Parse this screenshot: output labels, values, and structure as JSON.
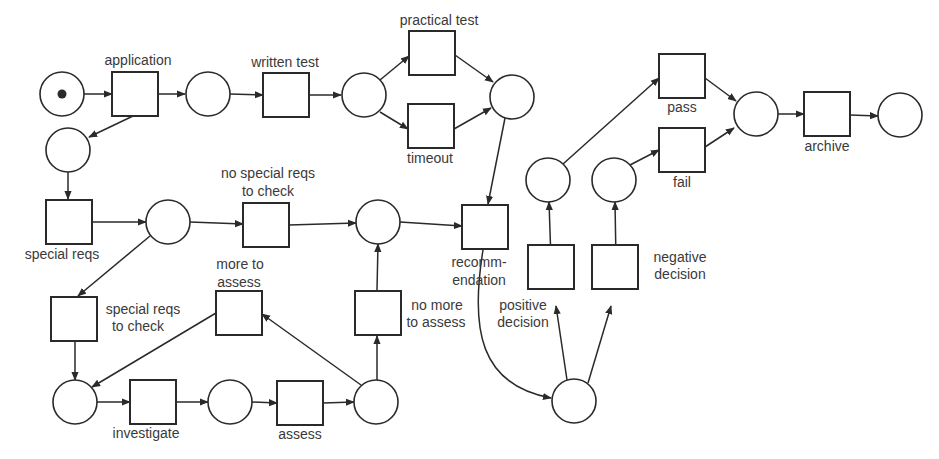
{
  "diagram": {
    "type": "petri-net",
    "colors": {
      "stroke": "#2a2a2a",
      "text": "#3a3a3a",
      "background": "#ffffff",
      "token": "#2a2a2a"
    },
    "transitions": [
      {
        "id": "t_application",
        "label": [
          "application"
        ]
      },
      {
        "id": "t_written_test",
        "label": [
          "written test"
        ]
      },
      {
        "id": "t_practical_test",
        "label": [
          "practical test"
        ]
      },
      {
        "id": "t_timeout",
        "label": [
          "timeout"
        ]
      },
      {
        "id": "t_special_reqs",
        "label": [
          "special reqs"
        ]
      },
      {
        "id": "t_no_special_reqs",
        "label": [
          "no special reqs",
          "to check"
        ]
      },
      {
        "id": "t_recommendation",
        "label": [
          "recomm-",
          "endation"
        ]
      },
      {
        "id": "t_special_reqs_to_check",
        "label": [
          "special reqs",
          "to check"
        ]
      },
      {
        "id": "t_more_to_assess",
        "label": [
          "more to",
          "assess"
        ]
      },
      {
        "id": "t_no_more_to_assess",
        "label": [
          "no more",
          "to assess"
        ]
      },
      {
        "id": "t_investigate",
        "label": [
          "investigate"
        ]
      },
      {
        "id": "t_assess",
        "label": [
          "assess"
        ]
      },
      {
        "id": "t_positive_decision",
        "label": [
          "positive",
          "decision"
        ]
      },
      {
        "id": "t_negative_decision",
        "label": [
          "negative",
          "decision"
        ]
      },
      {
        "id": "t_pass",
        "label": [
          "pass"
        ]
      },
      {
        "id": "t_fail",
        "label": [
          "fail"
        ]
      },
      {
        "id": "t_archive",
        "label": [
          "archive"
        ]
      }
    ],
    "places": [
      {
        "id": "p_start",
        "tokens": 1
      },
      {
        "id": "p_after_application",
        "tokens": 0
      },
      {
        "id": "p_after_written",
        "tokens": 0
      },
      {
        "id": "p_after_practical",
        "tokens": 0
      },
      {
        "id": "p_special",
        "tokens": 0
      },
      {
        "id": "p_reqs_check",
        "tokens": 0
      },
      {
        "id": "p_ready_recommend",
        "tokens": 0
      },
      {
        "id": "p_investigate",
        "tokens": 0
      },
      {
        "id": "p_assess",
        "tokens": 0
      },
      {
        "id": "p_assessed",
        "tokens": 0
      },
      {
        "id": "p_decision",
        "tokens": 0
      },
      {
        "id": "p_positive",
        "tokens": 0
      },
      {
        "id": "p_negative",
        "tokens": 0
      },
      {
        "id": "p_result",
        "tokens": 0
      },
      {
        "id": "p_end",
        "tokens": 0
      }
    ]
  }
}
